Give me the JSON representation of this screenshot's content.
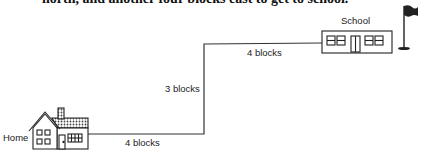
{
  "header": {
    "cut_off_text": "north, and another four blocks east to get to school."
  },
  "diagram": {
    "places": {
      "home": "Home",
      "school": "School"
    },
    "segments": [
      {
        "direction": "east",
        "label": "4 blocks"
      },
      {
        "direction": "north",
        "label": "3 blocks"
      },
      {
        "direction": "east",
        "label": "4 blocks"
      }
    ],
    "icons": [
      "house-icon",
      "school-building-icon",
      "flag-icon"
    ]
  }
}
